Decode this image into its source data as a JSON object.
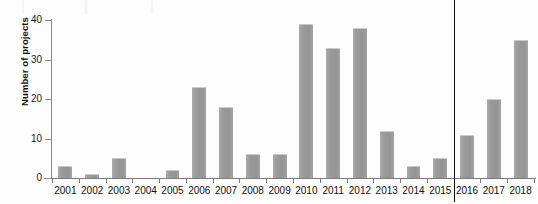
{
  "chart_data": {
    "type": "bar",
    "title": "",
    "xlabel": "",
    "ylabel": "Number of projects",
    "categories": [
      "2001",
      "2002",
      "2003",
      "2004",
      "2005",
      "2006",
      "2007",
      "2008",
      "2009",
      "2010",
      "2011",
      "2012",
      "2013",
      "2014",
      "2015",
      "2016",
      "2017",
      "2018"
    ],
    "values": [
      3,
      1,
      5,
      0,
      2,
      23,
      18,
      6,
      6,
      39,
      33,
      38,
      12,
      3,
      5,
      11,
      20,
      35
    ],
    "ylim": [
      0,
      40
    ],
    "yticks": [
      0,
      10,
      20,
      30,
      40
    ],
    "ytick_labels": [
      "0",
      "10",
      "20",
      "30",
      "40"
    ],
    "grid": false,
    "legend": null,
    "bar_color": "#9a9a9a",
    "annotations": [
      {
        "name": "vertical-divider",
        "kind": "vline",
        "between": [
          "2015",
          "2016"
        ],
        "color": "#0d0d0d"
      }
    ]
  }
}
